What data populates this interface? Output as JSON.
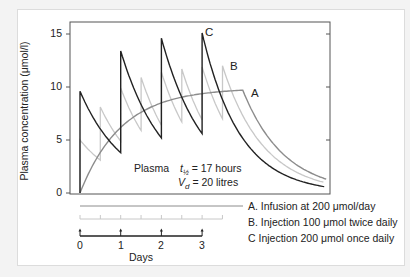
{
  "chart_data": {
    "type": "line",
    "title": "",
    "xlabel": "Days",
    "ylabel": "Plasma concentration (μmol/l)",
    "ylim": [
      0,
      16
    ],
    "xlim": [
      -0.25,
      6.1
    ],
    "yticks": [
      "0",
      "5",
      "10",
      "15"
    ],
    "xticks": [
      "0",
      "1",
      "2",
      "3"
    ],
    "grid": false,
    "legend_position": "bottom-right",
    "annotation": {
      "label": "Plasma",
      "half_life": "t½ = 17 hours",
      "volume": "Vd = 20 litres"
    },
    "series": [
      {
        "name": "A",
        "description": "A. Infusion at 200 μmol/day",
        "color": "#8c8c8c",
        "x": [
          0,
          0.5,
          1,
          1.5,
          2,
          2.5,
          3,
          3.5,
          4,
          4.5,
          5,
          5.5,
          6
        ],
        "y": [
          0,
          3.9,
          6.2,
          7.6,
          8.5,
          9.0,
          9.3,
          9.5,
          9.7,
          6.0,
          3.6,
          2.2,
          1.4
        ]
      },
      {
        "name": "B",
        "description": "B. Injection 100 μmol twice daily",
        "color": "#c8c8c8",
        "dose_times_days": [
          0,
          0.5,
          1,
          1.5,
          2,
          2.5,
          3,
          3.5
        ],
        "peaks": [
          5.0,
          8.1,
          9.9,
          10.9,
          11.4,
          11.7,
          11.9,
          12.0
        ],
        "troughs": [
          3.1,
          4.9,
          5.9,
          6.4,
          6.7,
          6.9,
          7.0
        ],
        "tail_end_value": 1.0
      },
      {
        "name": "C",
        "description": "C Injection 200 μmol once daily",
        "color": "#222222",
        "dose_times_days": [
          0,
          1,
          2,
          3
        ],
        "peaks": [
          9.6,
          13.4,
          14.6,
          15.1
        ],
        "troughs": [
          3.8,
          5.2,
          5.6
        ],
        "tail_end_value": 0.6
      }
    ],
    "dosing_schedule": {
      "A": "continuous line days 0-4",
      "B": "tick every 0.5 day, days 0-3.5",
      "C": "arrow at days 0,1,2,3"
    }
  },
  "labels": {
    "y_title": "Plasma concentration (μmol/l)",
    "y_ticks": [
      "15",
      "10",
      "5",
      "0"
    ],
    "curve_a": "A",
    "curve_b": "B",
    "curve_c": "C",
    "plasma": "Plasma",
    "t_half_sym": "t",
    "t_half_sub": "½",
    "t_half_val": "= 17 hours",
    "vd_sym": "V",
    "vd_sub": "d",
    "vd_val": "= 20 litres",
    "legend_a": "A. Infusion at 200 μmol/day",
    "legend_b": "B. Injection 100 μmol twice daily",
    "legend_c": "C Injection 200 μmol once daily",
    "day_ticks": [
      "0",
      "1",
      "2",
      "3"
    ],
    "days": "Days"
  }
}
